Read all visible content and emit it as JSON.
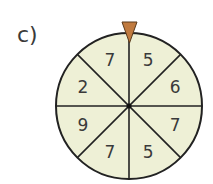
{
  "label": "c)",
  "spinner": {
    "sectors": [
      "5",
      "6",
      "7",
      "5",
      "7",
      "9",
      "2",
      "7"
    ],
    "sector_count": 8,
    "fill_color": "#eef0d6",
    "line_color": "#222222",
    "pointer_color": "#c07a3f"
  }
}
